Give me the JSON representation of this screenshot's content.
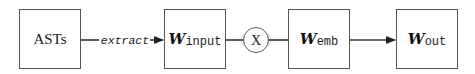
{
  "diagram": {
    "nodes": [
      {
        "id": "asts",
        "label": "ASTs",
        "type": "box"
      },
      {
        "id": "w_input",
        "symbol": "W",
        "subscript": "input",
        "type": "box"
      },
      {
        "id": "mult",
        "label": "X",
        "type": "circle"
      },
      {
        "id": "w_emb",
        "symbol": "W",
        "subscript": "emb",
        "type": "box"
      },
      {
        "id": "w_out",
        "symbol": "W",
        "subscript": "out",
        "type": "box"
      }
    ],
    "edges": [
      {
        "from": "asts",
        "to": "w_input",
        "label": "extract",
        "arrow": true
      },
      {
        "from": "w_input",
        "to": "mult",
        "label": "",
        "arrow": false
      },
      {
        "from": "mult",
        "to": "w_emb",
        "label": "",
        "arrow": false
      },
      {
        "from": "w_emb",
        "to": "w_out",
        "label": "",
        "arrow": true
      }
    ]
  }
}
